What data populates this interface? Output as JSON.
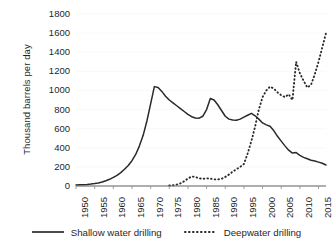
{
  "chart_data": {
    "type": "line",
    "title": "",
    "subtitle": "",
    "xlabel": "",
    "ylabel": "Thousand barrels per day",
    "xlim": [
      1950,
      2017
    ],
    "ylim": [
      0,
      1800
    ],
    "ytick_step": 200,
    "xtick_step": 5,
    "grid": true,
    "grid_axis": "y",
    "legend_position": "bottom",
    "y_ticks": [
      "0",
      "200",
      "400",
      "600",
      "800",
      "1000",
      "1200",
      "1400",
      "1600",
      "1800"
    ],
    "x_ticks": [
      "1950",
      "1955",
      "1960",
      "1965",
      "1970",
      "1975",
      "1980",
      "1985",
      "1990",
      "1995",
      "2000",
      "2005",
      "2010",
      "2015"
    ],
    "series": [
      {
        "name": "Shallow water drilling",
        "style": "solid",
        "color": "#2a2a2a",
        "x": [
          1950,
          1951,
          1952,
          1953,
          1954,
          1955,
          1956,
          1957,
          1958,
          1959,
          1960,
          1961,
          1962,
          1963,
          1964,
          1965,
          1966,
          1967,
          1968,
          1969,
          1970,
          1971,
          1972,
          1973,
          1974,
          1975,
          1976,
          1977,
          1978,
          1979,
          1980,
          1981,
          1982,
          1983,
          1984,
          1985,
          1986,
          1987,
          1988,
          1989,
          1990,
          1991,
          1992,
          1993,
          1994,
          1995,
          1996,
          1997,
          1998,
          1999,
          2000,
          2001,
          2002,
          2003,
          2004,
          2005,
          2006,
          2007,
          2008,
          2009,
          2010,
          2011,
          2012,
          2013,
          2014,
          2015,
          2016,
          2017
        ],
        "values": [
          10,
          12,
          14,
          16,
          20,
          25,
          32,
          42,
          55,
          70,
          90,
          112,
          140,
          175,
          215,
          265,
          330,
          420,
          530,
          680,
          860,
          1040,
          1030,
          990,
          940,
          900,
          870,
          840,
          810,
          780,
          750,
          725,
          712,
          710,
          730,
          800,
          915,
          900,
          850,
          790,
          730,
          700,
          690,
          688,
          700,
          720,
          740,
          760,
          735,
          700,
          660,
          640,
          625,
          580,
          520,
          470,
          420,
          375,
          345,
          350,
          320,
          300,
          285,
          270,
          262,
          250,
          238,
          220
        ]
      },
      {
        "name": "Deepwater drilling",
        "style": "dotted",
        "color": "#2a2a2a",
        "x": [
          1975,
          1976,
          1977,
          1978,
          1979,
          1980,
          1981,
          1982,
          1983,
          1984,
          1985,
          1986,
          1987,
          1988,
          1989,
          1990,
          1991,
          1992,
          1993,
          1994,
          1995,
          1996,
          1997,
          1998,
          1999,
          2000,
          2001,
          2002,
          2003,
          2004,
          2005,
          2006,
          2007,
          2008,
          2009,
          2010,
          2011,
          2012,
          2013,
          2014,
          2015,
          2016,
          2017
        ],
        "values": [
          5,
          8,
          15,
          28,
          50,
          78,
          100,
          95,
          80,
          75,
          80,
          78,
          70,
          68,
          75,
          95,
          120,
          150,
          175,
          200,
          230,
          340,
          470,
          620,
          800,
          930,
          1000,
          1040,
          1020,
          980,
          950,
          930,
          960,
          900,
          1300,
          1180,
          1100,
          1030,
          1060,
          1170,
          1300,
          1450,
          1600
        ]
      }
    ]
  },
  "axes": {
    "y_title": "Thousand barrels per day"
  },
  "legend": {
    "items": [
      {
        "label": "Shallow water drilling",
        "marker": "solid-line-swatch"
      },
      {
        "label": "Deepwater drilling",
        "marker": "dotted-line-swatch"
      }
    ]
  }
}
